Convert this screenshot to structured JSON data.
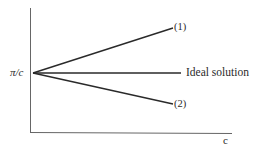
{
  "diagram": {
    "y_axis_label": "π/c",
    "x_axis_label": "c",
    "lines": [
      {
        "id": "1",
        "label": "(1)",
        "trend": "increasing"
      },
      {
        "id": "ideal",
        "label": "Ideal solution",
        "trend": "constant"
      },
      {
        "id": "2",
        "label": "(2)",
        "trend": "decreasing"
      }
    ],
    "colors": {
      "line": "#2a2a2a",
      "axis": "#555555",
      "background": "#ffffff"
    }
  }
}
